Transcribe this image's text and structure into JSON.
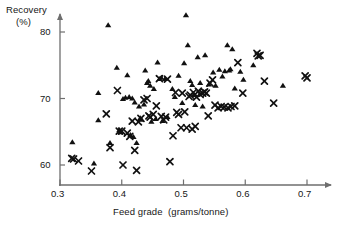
{
  "chart_data": {
    "type": "scatter",
    "title": "",
    "xlabel": "Feed grade  (grams/tonne)",
    "ylabel_line1": "Recovery",
    "ylabel_line2": "(%)",
    "xlim": [
      0.295,
      0.715
    ],
    "ylim": [
      58.2,
      83.5
    ],
    "xticks": [
      0.3,
      0.4,
      0.5,
      0.6,
      0.7
    ],
    "xticklabels": [
      "0.3",
      "0.4",
      "0.5",
      "0.6",
      "0.7"
    ],
    "yticks": [
      60,
      70,
      80
    ],
    "yticklabels": [
      "60",
      "70",
      "80"
    ],
    "grid": false,
    "legend": "none",
    "marker_color": "#111111",
    "axis_color": "#6e6e6e",
    "series": [
      {
        "name": "triangle",
        "marker": "triangle-up",
        "points": [
          [
            0.32,
            63.4
          ],
          [
            0.355,
            60.2
          ],
          [
            0.362,
            70.8
          ],
          [
            0.362,
            66.7
          ],
          [
            0.378,
            81.0
          ],
          [
            0.381,
            63.3
          ],
          [
            0.392,
            74.6
          ],
          [
            0.396,
            65.2
          ],
          [
            0.398,
            64.9
          ],
          [
            0.402,
            69.9
          ],
          [
            0.406,
            70.1
          ],
          [
            0.409,
            73.5
          ],
          [
            0.412,
            70.2
          ],
          [
            0.414,
            64.5
          ],
          [
            0.417,
            70.0
          ],
          [
            0.419,
            64.2
          ],
          [
            0.421,
            69.4
          ],
          [
            0.424,
            63.3
          ],
          [
            0.428,
            68.8
          ],
          [
            0.43,
            67.0
          ],
          [
            0.432,
            66.8
          ],
          [
            0.436,
            69.1
          ],
          [
            0.438,
            74.2
          ],
          [
            0.441,
            72.3
          ],
          [
            0.443,
            72.6
          ],
          [
            0.446,
            71.9
          ],
          [
            0.448,
            66.5
          ],
          [
            0.452,
            71.4
          ],
          [
            0.455,
            66.9
          ],
          [
            0.458,
            75.4
          ],
          [
            0.461,
            72.9
          ],
          [
            0.464,
            73.1
          ],
          [
            0.466,
            66.6
          ],
          [
            0.47,
            72.9
          ],
          [
            0.474,
            67.2
          ],
          [
            0.482,
            71.4
          ],
          [
            0.486,
            70.2
          ],
          [
            0.492,
            73.4
          ],
          [
            0.498,
            69.3
          ],
          [
            0.501,
            75.3
          ],
          [
            0.504,
            82.5
          ],
          [
            0.507,
            78.0
          ],
          [
            0.511,
            72.6
          ],
          [
            0.514,
            72.0
          ],
          [
            0.517,
            70.5
          ],
          [
            0.519,
            69.0
          ],
          [
            0.523,
            76.2
          ],
          [
            0.527,
            72.3
          ],
          [
            0.531,
            68.8
          ],
          [
            0.535,
            76.5
          ],
          [
            0.541,
            72.1
          ],
          [
            0.548,
            73.9
          ],
          [
            0.552,
            71.9
          ],
          [
            0.558,
            74.3
          ],
          [
            0.563,
            73.3
          ],
          [
            0.567,
            74.1
          ],
          [
            0.571,
            78.0
          ],
          [
            0.574,
            74.2
          ],
          [
            0.576,
            74.4
          ],
          [
            0.579,
            77.4
          ],
          [
            0.583,
            71.5
          ],
          [
            0.592,
            74.0
          ],
          [
            0.597,
            72.8
          ],
          [
            0.613,
            75.0
          ],
          [
            0.661,
            71.9
          ]
        ]
      },
      {
        "name": "cross",
        "marker": "x",
        "points": [
          [
            0.319,
            61.0
          ],
          [
            0.322,
            60.9
          ],
          [
            0.33,
            60.6
          ],
          [
            0.351,
            59.1
          ],
          [
            0.375,
            67.7
          ],
          [
            0.381,
            62.6
          ],
          [
            0.393,
            71.2
          ],
          [
            0.396,
            65.1
          ],
          [
            0.4,
            65.1
          ],
          [
            0.402,
            60.0
          ],
          [
            0.409,
            64.8
          ],
          [
            0.413,
            64.3
          ],
          [
            0.417,
            66.6
          ],
          [
            0.421,
            62.2
          ],
          [
            0.424,
            59.2
          ],
          [
            0.427,
            66.5
          ],
          [
            0.431,
            67.0
          ],
          [
            0.436,
            69.8
          ],
          [
            0.441,
            70.0
          ],
          [
            0.444,
            67.4
          ],
          [
            0.446,
            67.2
          ],
          [
            0.451,
            67.6
          ],
          [
            0.456,
            68.9
          ],
          [
            0.461,
            73.0
          ],
          [
            0.464,
            67.3
          ],
          [
            0.468,
            66.8
          ],
          [
            0.471,
            67.2
          ],
          [
            0.474,
            72.9
          ],
          [
            0.478,
            60.5
          ],
          [
            0.483,
            64.4
          ],
          [
            0.487,
            70.9
          ],
          [
            0.489,
            67.9
          ],
          [
            0.492,
            67.6
          ],
          [
            0.496,
            65.6
          ],
          [
            0.498,
            70.8
          ],
          [
            0.502,
            68.0
          ],
          [
            0.505,
            65.6
          ],
          [
            0.509,
            70.3
          ],
          [
            0.511,
            70.5
          ],
          [
            0.514,
            65.4
          ],
          [
            0.516,
            70.9
          ],
          [
            0.519,
            65.8
          ],
          [
            0.521,
            70.2
          ],
          [
            0.524,
            71.1
          ],
          [
            0.527,
            70.6
          ],
          [
            0.531,
            70.8
          ],
          [
            0.534,
            71.0
          ],
          [
            0.537,
            70.8
          ],
          [
            0.54,
            67.4
          ],
          [
            0.543,
            72.3
          ],
          [
            0.547,
            72.8
          ],
          [
            0.551,
            69.0
          ],
          [
            0.556,
            68.6
          ],
          [
            0.561,
            68.8
          ],
          [
            0.566,
            68.7
          ],
          [
            0.572,
            68.6
          ],
          [
            0.577,
            68.8
          ],
          [
            0.583,
            68.9
          ],
          [
            0.588,
            75.4
          ],
          [
            0.596,
            70.8
          ],
          [
            0.619,
            76.8
          ],
          [
            0.621,
            76.4
          ],
          [
            0.624,
            76.5
          ],
          [
            0.631,
            72.6
          ],
          [
            0.646,
            69.3
          ],
          [
            0.697,
            73.4
          ],
          [
            0.7,
            73.1
          ]
        ]
      }
    ]
  }
}
